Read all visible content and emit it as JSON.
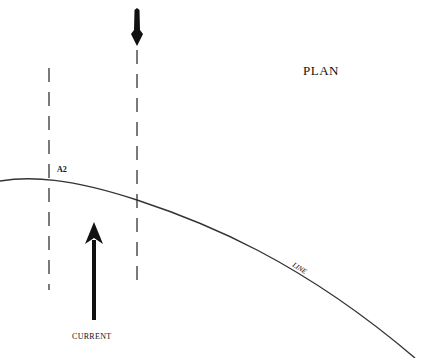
{
  "diagram": {
    "title": "PLAN",
    "labels": {
      "station": "A2",
      "current": "CURRENT",
      "line": "LINE"
    },
    "colors": {
      "ink": "#111111",
      "line": "#333333",
      "background": "#ffffff"
    }
  }
}
